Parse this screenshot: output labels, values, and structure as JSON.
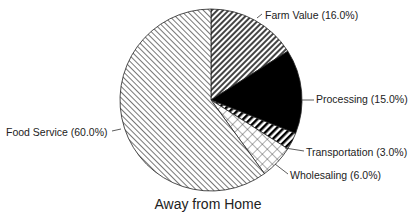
{
  "chart_data": {
    "type": "pie",
    "title": "Away from Home",
    "slices": [
      {
        "label": "Farm Value",
        "value": 16.0,
        "display": "Farm Value (16.0%)",
        "pattern": "dense-diagonal-dark"
      },
      {
        "label": "Processing",
        "value": 15.0,
        "display": "Processing (15.0%)",
        "pattern": "solid-black"
      },
      {
        "label": "Transportation",
        "value": 3.0,
        "display": "Transportation (3.0%)",
        "pattern": "thick-diagonal-stripes"
      },
      {
        "label": "Wholesaling",
        "value": 6.0,
        "display": "Wholesaling (6.0%)",
        "pattern": "crosshatch"
      },
      {
        "label": "Food Service",
        "value": 60.0,
        "display": "Food Service (60.0%)",
        "pattern": "light-diagonal"
      }
    ],
    "start_angle": "12 o'clock, clockwise",
    "legend": "callout labels"
  }
}
